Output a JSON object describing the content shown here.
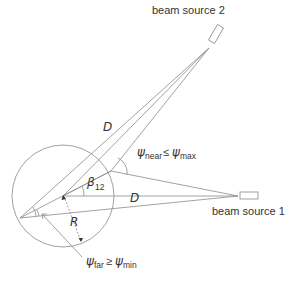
{
  "labels": {
    "beam_source_2": "beam source 2",
    "beam_source_1": "beam source 1",
    "distance_upper": "D",
    "distance_lower": "D",
    "angle_beta": "β",
    "angle_beta_sub": "12",
    "radius": "R",
    "psi_near_symbol": "ψ",
    "psi_near_sub": "near",
    "psi_near_relation": "≤",
    "psi_max_symbol": "ψ",
    "psi_max_sub": "max",
    "psi_far_symbol": "ψ",
    "psi_far_sub": "far",
    "psi_far_relation": "≥",
    "psi_min_symbol": "ψ",
    "psi_min_sub": "min"
  },
  "colors": {
    "line": "#8a8a8a",
    "text": "#333333"
  }
}
